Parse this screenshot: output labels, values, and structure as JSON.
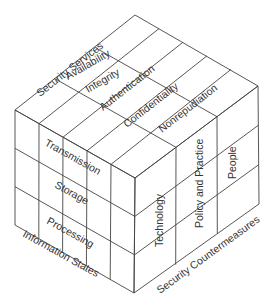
{
  "diagram": {
    "axes": {
      "top": {
        "label": "Security Services",
        "items": [
          "Availability",
          "Integrity",
          "Authentication",
          "Confidentiality",
          "Nonrepudiation"
        ]
      },
      "left": {
        "label": "Information States",
        "items": [
          "Transmission",
          "Storage",
          "Processing"
        ]
      },
      "right": {
        "label": "Security Countermeasures",
        "items": [
          "Technology",
          "Policy and Practice",
          "People"
        ]
      }
    }
  }
}
